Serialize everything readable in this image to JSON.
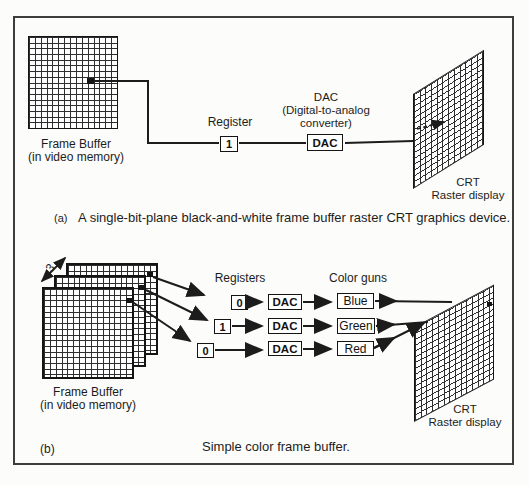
{
  "palette": {
    "ink": "#1c1c1c",
    "paper": "#ffffff"
  },
  "figure": {
    "part_a": {
      "tag": "(a)",
      "caption": "A single-bit-plane black-and-white frame buffer raster CRT graphics device.",
      "frame_buffer_label_line1": "Frame Buffer",
      "frame_buffer_label_line2": "(in video memory)",
      "register_label": "Register",
      "register_value": "1",
      "dac_caption_line1": "DAC",
      "dac_caption_line2": "(Digital-to-analog",
      "dac_caption_line3": "converter)",
      "dac_box_label": "DAC",
      "crt_label_line1": "CRT",
      "crt_label_line2": "Raster display"
    },
    "part_b": {
      "tag": "(b)",
      "caption": "Simple color frame buffer.",
      "plane_count": "3",
      "registers_label": "Registers",
      "register_values": [
        "0",
        "1",
        "0"
      ],
      "dac_boxes": [
        "DAC",
        "DAC",
        "DAC"
      ],
      "color_guns_label": "Color guns",
      "gun_labels": [
        "Blue",
        "Green",
        "Red"
      ],
      "frame_buffer_label_line1": "Frame Buffer",
      "frame_buffer_label_line2": "(in video memory)",
      "crt_label_line1": "CRT",
      "crt_label_line2": "Raster display"
    }
  }
}
